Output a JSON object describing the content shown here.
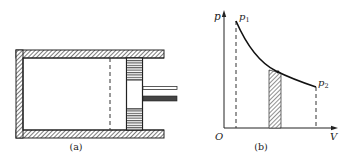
{
  "figure_a": {
    "caption": "(a)",
    "parts": [
      "cylinder",
      "piston",
      "piston-rod",
      "dashed-position-line"
    ]
  },
  "figure_b": {
    "caption": "(b)",
    "y_axis_label": "p",
    "x_axis_label": "V",
    "origin_label": "O",
    "point1_label": "p",
    "point1_sub": "1",
    "point2_label": "p",
    "point2_sub": "2",
    "curve": "p-V isotherm (decreasing hyperbola)",
    "shaded_strip": "small volume element under curve"
  },
  "colors": {
    "ink": "#222222",
    "hatch": "#555555",
    "background": "#ffffff"
  }
}
